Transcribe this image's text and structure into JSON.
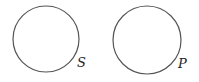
{
  "diagram": {
    "type": "two-circles",
    "stroke_color": "#555555",
    "circles": [
      {
        "label": "S",
        "cx": 46,
        "cy": 39,
        "r": 33
      },
      {
        "label": "P",
        "cx": 147,
        "cy": 40,
        "r": 34
      }
    ]
  }
}
